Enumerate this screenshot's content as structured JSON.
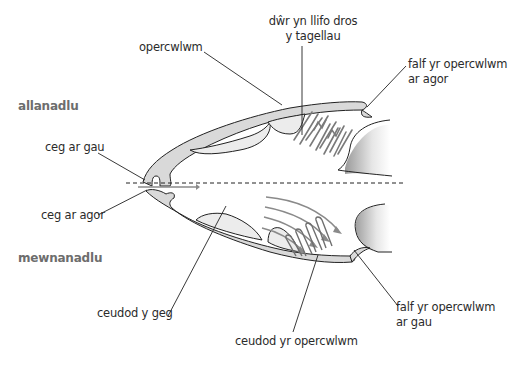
{
  "diagram": {
    "phases": {
      "exhale": "allanadlu",
      "inhale": "mewnanadlu"
    },
    "labels": {
      "operculum": "opercwlwm",
      "water_over_gills_line1": "dŵr yn llifo dros",
      "water_over_gills_line2": "y tagellau",
      "valve_open_line1": "falf yr opercwlwm",
      "valve_open_line2": "ar agor",
      "mouth_closed": "ceg ar gau",
      "mouth_open": "ceg ar agor",
      "buccal_cavity": "ceudod y geg",
      "opercular_cavity": "ceudod yr opercwlwm",
      "valve_closed_line1": "falf yr opercwlwm",
      "valve_closed_line2": "ar gau"
    },
    "colors": {
      "outline": "#222222",
      "fill_light": "#d9d9d9",
      "fill_lighter": "#ececec",
      "gill": "#7a7a7a",
      "arrow": "#8a8a8a",
      "phase_text": "#6d6d6d",
      "label_text": "#2b2b2b"
    }
  }
}
